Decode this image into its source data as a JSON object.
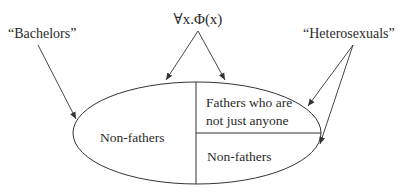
{
  "diagram": {
    "top_label": "∀x.Φ(x)",
    "left_label": "“Bachelors”",
    "right_label": "“Heterosexuals”",
    "regions": {
      "left": "Non-fathers",
      "upper_right_line1": "Fathers who are",
      "upper_right_line2": "not just anyone",
      "lower_right": "Non-fathers"
    },
    "colors": {
      "stroke": "#333333",
      "text": "#2a2a2a",
      "background": "#ffffff"
    }
  }
}
